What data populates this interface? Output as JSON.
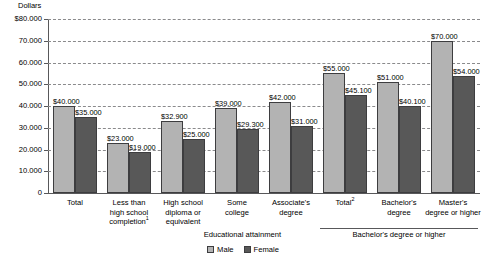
{
  "chart_data": {
    "type": "bar",
    "title": "",
    "subtitle": "",
    "unit_label": "Dollars",
    "xlabel": "Educational attainment",
    "ylabel": "",
    "ylim": [
      0,
      80000
    ],
    "grid": true,
    "legend_position": "bottom-center",
    "categories": [
      "Total",
      "Less than high school completion¹",
      "High school diploma or equivalent",
      "Some college",
      "Associate's degree",
      "Total²",
      "Bachelor's degree",
      "Master's degree or higher"
    ],
    "series": [
      {
        "name": "Male",
        "color": "#b3b3b3",
        "values": [
          40000,
          23000,
          32900,
          39000,
          42000,
          55000,
          51000,
          70000
        ],
        "labels": [
          "$40.000",
          "$23.000",
          "$32.900",
          "$39.000",
          "$42.000",
          "$55.000",
          "$51.000",
          "$70.000"
        ]
      },
      {
        "name": "Female",
        "color": "#585858",
        "values": [
          35000,
          19000,
          25000,
          29300,
          31000,
          45100,
          40100,
          54000
        ],
        "labels": [
          "$35.000",
          "$19.000",
          "$25.000",
          "$29.300",
          "$31.000",
          "$45.100",
          "$40.100",
          "$54.000"
        ]
      }
    ],
    "yticks": [
      0,
      10000,
      20000,
      30000,
      40000,
      50000,
      60000,
      70000,
      80000
    ],
    "ytick_labels": [
      "0",
      "10.000",
      "20.000",
      "30.000",
      "40.000",
      "50.000",
      "60.000",
      "70.000",
      "$80.000"
    ],
    "bracket": {
      "label": "Bachelor's degree or higher",
      "covers": [
        "Total²",
        "Bachelor's degree",
        "Master's degree or higher"
      ]
    },
    "footnote_markers": [
      "1",
      "2"
    ]
  },
  "category_lines": [
    [
      "Total"
    ],
    [
      "Less than",
      "high school",
      "completion"
    ],
    [
      "High school",
      "diploma or",
      "equivalent"
    ],
    [
      "Some",
      "college"
    ],
    [
      "Associate's",
      "degree"
    ],
    [
      "Total"
    ],
    [
      "Bachelor's",
      "degree"
    ],
    [
      "Master's",
      "degree or higher"
    ]
  ],
  "legend": {
    "items": [
      {
        "label": "Male",
        "swatch": "male"
      },
      {
        "label": "Female",
        "swatch": "female"
      }
    ]
  }
}
